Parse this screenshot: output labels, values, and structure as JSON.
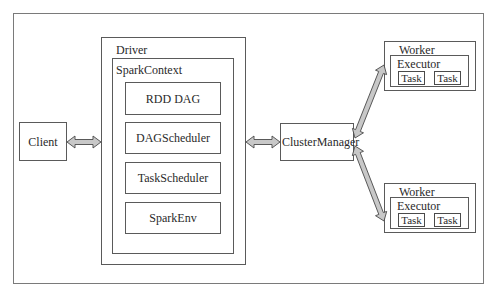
{
  "diagram": {
    "client": {
      "label": "Client"
    },
    "driver": {
      "label": "Driver",
      "spark_context": {
        "label": "SparkContext",
        "components": [
          {
            "label": "RDD DAG"
          },
          {
            "label": "DAGScheduler"
          },
          {
            "label": "TaskScheduler"
          },
          {
            "label": "SparkEnv"
          }
        ]
      }
    },
    "cluster_manager": {
      "label": "ClusterManager"
    },
    "workers": [
      {
        "label": "Worker",
        "executor": {
          "label": "Executor",
          "tasks": [
            "Task",
            "Task"
          ]
        }
      },
      {
        "label": "Worker",
        "executor": {
          "label": "Executor",
          "tasks": [
            "Task",
            "Task"
          ]
        }
      }
    ],
    "connections": [
      {
        "from": "Client",
        "to": "Driver",
        "type": "bidirectional"
      },
      {
        "from": "Driver",
        "to": "ClusterManager",
        "type": "bidirectional"
      },
      {
        "from": "ClusterManager",
        "to": "Worker 1",
        "type": "bidirectional"
      },
      {
        "from": "ClusterManager",
        "to": "Worker 2",
        "type": "bidirectional"
      }
    ],
    "colors": {
      "border": "#5a5a5a",
      "arrow_fill": "#c8c8c8",
      "arrow_stroke": "#4a4a4a",
      "text": "#2a2a2a"
    }
  }
}
